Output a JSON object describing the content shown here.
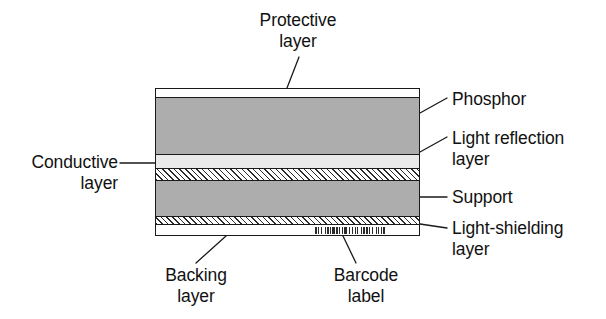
{
  "diagram": {
    "colors": {
      "outline": "#1a1a1a",
      "phosphor_fill": "#adadad",
      "support_fill": "#adadad",
      "light_reflection_fill": "#eaeaea",
      "protective_fill": "#ffffff",
      "backing_fill": "#ffffff",
      "hatch_line": "#2b2b2b",
      "barcode_bar": "#2a2a2a",
      "text": "#111111"
    },
    "layers": [
      {
        "id": "protective",
        "label": "Protective\nlayer",
        "fill": "plain",
        "top_pct": 0,
        "height_pct": 6.1
      },
      {
        "id": "phosphor",
        "label": "Phosphor",
        "fill": "gray",
        "top_pct": 6.1,
        "height_pct": 39.2
      },
      {
        "id": "light-reflection",
        "label": "Light reflection\nlayer",
        "fill": "light",
        "top_pct": 45.3,
        "height_pct": 9.5
      },
      {
        "id": "conductive",
        "label": "Conductive\nlayer",
        "fill": "hatch",
        "top_pct": 54.8,
        "height_pct": 8.1
      },
      {
        "id": "support",
        "label": "Support",
        "fill": "gray",
        "top_pct": 62.9,
        "height_pct": 25.0
      },
      {
        "id": "light-shielding",
        "label": "Light-shielding\nlayer",
        "fill": "hatch",
        "top_pct": 87.9,
        "height_pct": 5.4
      },
      {
        "id": "backing",
        "label": "Backing\nlayer",
        "fill": "plain",
        "top_pct": 93.3,
        "height_pct": 6.7
      }
    ],
    "barcode": {
      "label": "Barcode\nlabel",
      "bars": [
        2,
        1,
        1,
        2,
        1,
        3,
        1,
        1,
        2,
        1,
        1,
        1,
        3,
        1,
        2,
        1,
        1,
        2,
        1,
        1,
        3,
        1,
        1,
        2,
        1,
        2,
        1,
        1,
        1,
        3,
        1,
        1,
        2,
        1,
        2,
        1,
        1,
        2,
        1,
        3,
        1,
        1,
        1,
        2,
        1,
        1,
        2
      ]
    },
    "callouts": {
      "protective": "Protective\nlayer",
      "phosphor": "Phosphor",
      "light_reflection": "Light reflection\nlayer",
      "conductive": "Conductive\nlayer",
      "support": "Support",
      "light_shielding": "Light-shielding\nlayer",
      "backing": "Backing\nlayer",
      "barcode": "Barcode\nlabel"
    }
  }
}
